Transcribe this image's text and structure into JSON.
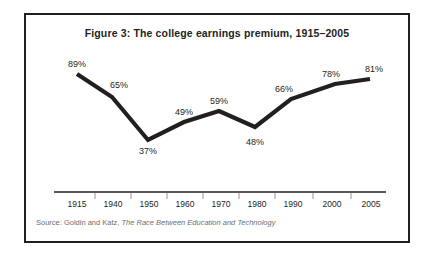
{
  "figure": {
    "title": "Figure 3: The college earnings premium, 1915–2005",
    "source_prefix": "Source: Goldin and Katz, ",
    "source_book": "The Race Between Education and Technology",
    "border_color": "#231f20",
    "line_color": "#231f20",
    "background_color": "#ffffff",
    "source_color": "#6d6e71"
  },
  "chart_data": {
    "type": "line",
    "title": "Figure 3: The college earnings premium, 1915–2005",
    "xlabel": "",
    "ylabel": "",
    "categories": [
      "1915",
      "1940",
      "1950",
      "1960",
      "1970",
      "1980",
      "1990",
      "2000",
      "2005"
    ],
    "values": [
      89,
      65,
      37,
      49,
      59,
      48,
      66,
      78,
      81
    ],
    "value_labels": [
      "89%",
      "65%",
      "37%",
      "49%",
      "59%",
      "48%",
      "66%",
      "78%",
      "81%"
    ],
    "units": "percent",
    "ylim": [
      30,
      95
    ],
    "grid": false,
    "legend": null,
    "axis": {
      "x_axis_visible": true,
      "y_axis_visible": false,
      "ticks_between_labels": true
    },
    "source": "Source: Goldin and Katz, The Race Between Education and Technology"
  },
  "points": [
    {
      "label": "89%",
      "year": "1915",
      "x": 51,
      "y": 59,
      "lx": 51,
      "ly": 44
    },
    {
      "label": "65%",
      "year": "1940",
      "x": 86,
      "y": 82,
      "lx": 93,
      "ly": 65
    },
    {
      "label": "37%",
      "year": "1950",
      "x": 122,
      "y": 125,
      "lx": 122,
      "ly": 131
    },
    {
      "label": "49%",
      "year": "1960",
      "x": 158,
      "y": 107,
      "lx": 158,
      "ly": 92
    },
    {
      "label": "59%",
      "year": "1970",
      "x": 193,
      "y": 96,
      "lx": 193,
      "ly": 81
    },
    {
      "label": "48%",
      "year": "1980",
      "x": 229,
      "y": 112,
      "lx": 229,
      "ly": 122
    },
    {
      "label": "66%",
      "year": "1990",
      "x": 265,
      "y": 84,
      "lx": 258,
      "ly": 69
    },
    {
      "label": "78%",
      "year": "2000",
      "x": 309,
      "y": 69,
      "lx": 305,
      "ly": 54
    },
    {
      "label": "81%",
      "year": "2005",
      "x": 344,
      "y": 64,
      "lx": 348,
      "ly": 49
    }
  ],
  "axis_labels": [
    {
      "text": "1915",
      "x": 51
    },
    {
      "text": "1940",
      "x": 87
    },
    {
      "text": "1950",
      "x": 123
    },
    {
      "text": "1960",
      "x": 159
    },
    {
      "text": "1970",
      "x": 195
    },
    {
      "text": "1980",
      "x": 231
    },
    {
      "text": "1990",
      "x": 267
    },
    {
      "text": "2000",
      "x": 306
    },
    {
      "text": "2005",
      "x": 345
    }
  ],
  "axis_ticks": [
    {
      "x": 69
    },
    {
      "x": 105
    },
    {
      "x": 141
    },
    {
      "x": 177
    },
    {
      "x": 213
    },
    {
      "x": 249
    },
    {
      "x": 287
    },
    {
      "x": 325
    }
  ]
}
